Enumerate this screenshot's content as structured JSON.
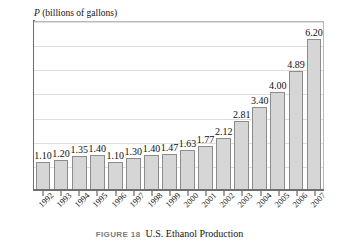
{
  "top_bleed_text": "",
  "axis": {
    "y_label_symbol": "P",
    "y_label_text": "(billions of gallons)"
  },
  "caption": {
    "figure_number": "FIGURE 18",
    "title": "U.S. Ethanol Production"
  },
  "colors": {
    "bar_fill": "#d6d6d6",
    "bar_border": "#8c8c8c",
    "gridline": "#dedede",
    "axis": "#6e6e6e",
    "frame": "#b9b9b9",
    "caption_label": "#7b7b7b",
    "text": "#141414",
    "background": "#ffffff"
  },
  "chart_data": {
    "type": "bar",
    "title": "U.S. Ethanol Production",
    "xlabel": "",
    "ylabel": "P (billions of gallons)",
    "ylim": [
      0,
      7
    ],
    "grid": true,
    "gridlines": [
      1,
      2,
      3,
      4,
      5,
      6,
      7
    ],
    "legend": null,
    "value_labels": true,
    "categories": [
      "1992",
      "1993",
      "1994",
      "1995",
      "1996",
      "1997",
      "1998",
      "1999",
      "2000",
      "2001",
      "2002",
      "2003",
      "2004",
      "2005",
      "2006",
      "2007"
    ],
    "values": [
      1.1,
      1.2,
      1.35,
      1.4,
      1.1,
      1.3,
      1.4,
      1.47,
      1.63,
      1.77,
      2.12,
      2.81,
      3.4,
      4.0,
      4.89,
      6.2
    ],
    "value_label_text": [
      "1.10",
      "1.20",
      "1.35",
      "1.40",
      "1.10",
      "1.30",
      "1.40",
      "1.47",
      "1.63",
      "1.77",
      "2.12",
      "2.81",
      "3.40",
      "4.00",
      "4.89",
      "6.20"
    ]
  }
}
